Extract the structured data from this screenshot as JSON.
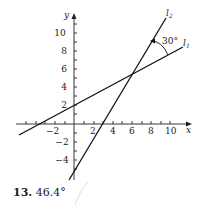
{
  "problem": {
    "number": "13.",
    "answer": "46.4°"
  },
  "diagram": {
    "x_axis_label": "x",
    "y_axis_label": "y",
    "x_tick_labels": [
      "−2",
      "2",
      "4",
      "6",
      "8",
      "10"
    ],
    "y_tick_labels": [
      "10",
      "8",
      "6",
      "4",
      "2",
      "−2",
      "−4"
    ],
    "lines": [
      {
        "name": "l1",
        "label": "l",
        "subscript": "1"
      },
      {
        "name": "l2",
        "label": "l",
        "subscript": "2"
      }
    ],
    "angle_label": "30°",
    "line_color": "#111111"
  }
}
